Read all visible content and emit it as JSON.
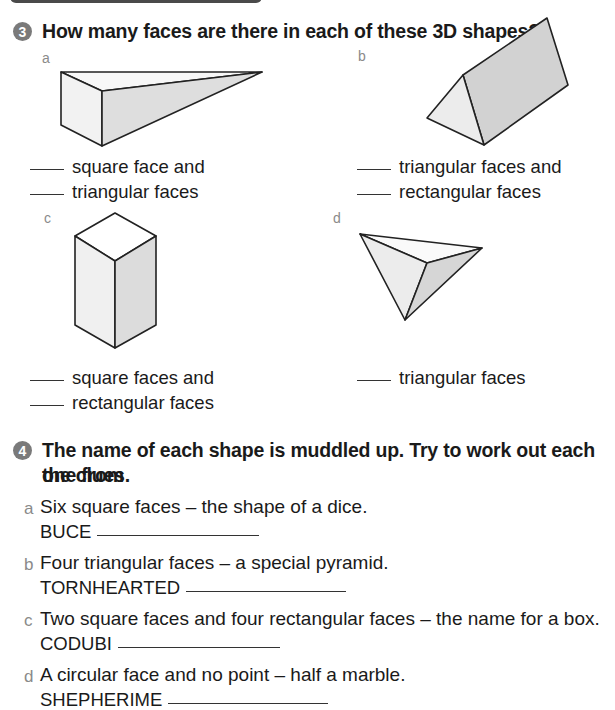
{
  "colors": {
    "text": "#1a1a1a",
    "badge": "#7a7a7a",
    "sublabel": "#8a8a8a",
    "face_light": "#f2f2f2",
    "face_mid": "#e6e6e6",
    "face_dark": "#d4d4d4",
    "topbar": "#4a4a4a"
  },
  "q3": {
    "number": "3",
    "title": "How many faces are there in each of these 3D shapes?",
    "shapes": [
      {
        "label": "a",
        "shape": "square-based-wedge-pyramid",
        "lines": [
          "square face and",
          "triangular faces"
        ]
      },
      {
        "label": "b",
        "shape": "triangular-prism",
        "lines": [
          "triangular faces and",
          "rectangular faces"
        ]
      },
      {
        "label": "c",
        "shape": "square-cuboid",
        "lines": [
          "square faces and",
          "rectangular faces"
        ]
      },
      {
        "label": "d",
        "shape": "tetrahedron",
        "lines": [
          "triangular faces"
        ]
      }
    ]
  },
  "q4": {
    "number": "4",
    "title_line1": "The name of each shape is muddled up. Try to work out each one from",
    "title_line2": "the clues.",
    "clues": [
      {
        "label": "a",
        "text": "Six square faces – the shape of a dice.",
        "anagram": "BUCE"
      },
      {
        "label": "b",
        "text": "Four triangular faces – a special pyramid.",
        "anagram": "TORNHEARTED"
      },
      {
        "label": "c",
        "text": "Two square faces and four rectangular faces – the name for a box.",
        "anagram": "CODUBI"
      },
      {
        "label": "d",
        "text": "A circular face and no point – half a marble.",
        "anagram": "SHEPHERIME"
      }
    ]
  }
}
